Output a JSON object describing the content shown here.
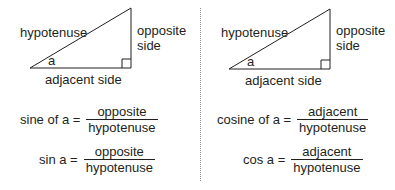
{
  "left": {
    "triangle": {
      "hypotenuse_label": "hypotenuse",
      "opposite_label_line1": "opposite",
      "opposite_label_line2": "side",
      "adjacent_label": "adjacent side",
      "angle_label": "a"
    },
    "formulas": [
      {
        "lhs": "sine of a =",
        "numerator": "opposite",
        "denominator": "hypotenuse"
      },
      {
        "lhs": "sin a =",
        "numerator": "opposite",
        "denominator": "hypotenuse"
      }
    ]
  },
  "right": {
    "triangle": {
      "hypotenuse_label": "hypotenuse",
      "opposite_label_line1": "opposite",
      "opposite_label_line2": "side",
      "adjacent_label": "adjacent side",
      "angle_label": "a"
    },
    "formulas": [
      {
        "lhs": "cosine of a =",
        "numerator": "adjacent",
        "denominator": "hypotenuse"
      },
      {
        "lhs": "cos a =",
        "numerator": "adjacent",
        "denominator": "hypotenuse"
      }
    ]
  }
}
